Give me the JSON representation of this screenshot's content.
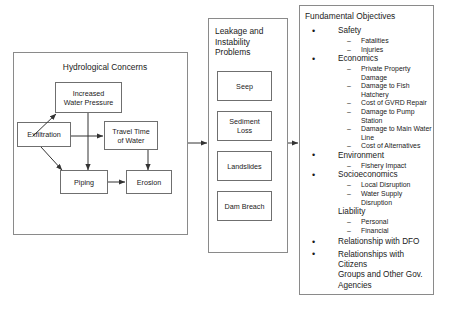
{
  "diagram": {
    "title_hydrological": "Hydrological Concerns",
    "title_leakage": "Leakage and\nInstability\nProblems",
    "title_objectives": "Fundamental Objectives",
    "hydrological_nodes": [
      {
        "id": "increased-water-pressure",
        "label": "Increased\nWater Pressure"
      },
      {
        "id": "exfiltration",
        "label": "Exfiltration"
      },
      {
        "id": "travel-time-of-water",
        "label": "Travel Time\nof Water"
      },
      {
        "id": "piping",
        "label": "Piping"
      },
      {
        "id": "erosion",
        "label": "Erosion"
      }
    ],
    "leakage_nodes": [
      {
        "id": "seep",
        "label": "Seep"
      },
      {
        "id": "sediment-loss",
        "label": "Sediment\nLoss"
      },
      {
        "id": "landslides",
        "label": "Landslides"
      },
      {
        "id": "dam-breach",
        "label": "Dam Breach"
      }
    ],
    "objectives": [
      {
        "bullet": "•",
        "label": "Safety",
        "children": [
          "Fatalities",
          "Injuries"
        ]
      },
      {
        "bullet": "•",
        "label": "Economics",
        "children": [
          "Private Property Damage",
          "Damage  to Fish Hatchery",
          "Cost of GVRD Repair",
          "Damage  to Pump Station",
          "Damage  to Main Water\nLine",
          "Cost of Alternatives"
        ]
      },
      {
        "bullet": "•",
        "label": "Environment",
        "children": [
          "Fishery Impact"
        ]
      },
      {
        "bullet": "•",
        "label": "Socioeconomics",
        "children": [
          "Local Disruption",
          "Water Supply Disruption"
        ]
      },
      {
        "bullet": "",
        "label": "Liability",
        "children": [
          "Personal",
          "Financial"
        ]
      },
      {
        "bullet": "•",
        "label": "Relationship with DFO",
        "children": []
      },
      {
        "bullet": "•",
        "label": "Relationships with Citizens\nGroups and Other Gov.\nAgencies",
        "children": []
      }
    ]
  }
}
